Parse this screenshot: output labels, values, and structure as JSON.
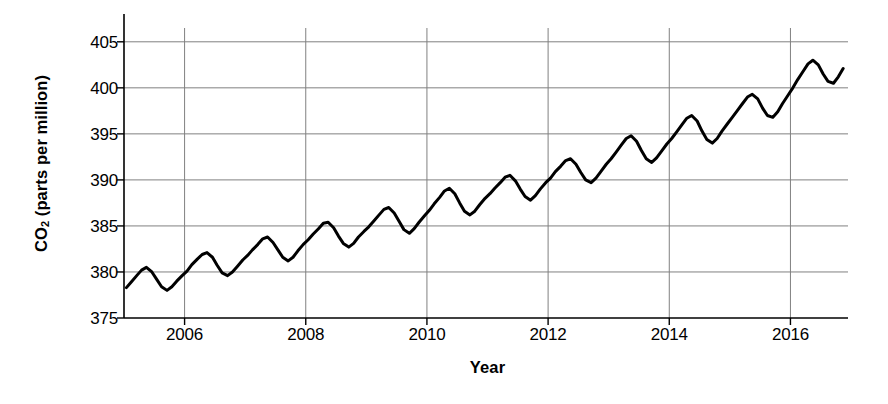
{
  "chart_data": {
    "type": "line",
    "title": "",
    "xlabel": "Year",
    "ylabel": "CO2 (parts per million)",
    "ylabel_parts": {
      "pre": "CO",
      "sub": "2",
      "post": " (parts per million)"
    },
    "xlim": [
      2005.0,
      2016.95
    ],
    "ylim": [
      375,
      406.5
    ],
    "yticks": [
      375,
      380,
      385,
      390,
      395,
      400,
      405
    ],
    "ytick_labels": [
      "375",
      "380",
      "385",
      "390",
      "395",
      "400",
      "405"
    ],
    "xticks": [
      2006,
      2008,
      2010,
      2012,
      2014,
      2016
    ],
    "xtick_labels": [
      "2006",
      "2008",
      "2010",
      "2012",
      "2014",
      "2016"
    ],
    "grid": true,
    "grid_color": "#808080",
    "line_color": "#000000",
    "line_width": 3.0,
    "axis_color": "#000000",
    "series_name": "Atmospheric CO2 concentration",
    "x": [
      2005.04,
      2005.12,
      2005.21,
      2005.29,
      2005.37,
      2005.46,
      2005.54,
      2005.62,
      2005.71,
      2005.79,
      2005.87,
      2005.96,
      2006.04,
      2006.12,
      2006.21,
      2006.29,
      2006.37,
      2006.46,
      2006.54,
      2006.62,
      2006.71,
      2006.79,
      2006.87,
      2006.96,
      2007.04,
      2007.12,
      2007.21,
      2007.29,
      2007.37,
      2007.46,
      2007.54,
      2007.62,
      2007.71,
      2007.79,
      2007.87,
      2007.96,
      2008.04,
      2008.12,
      2008.21,
      2008.29,
      2008.37,
      2008.46,
      2008.54,
      2008.62,
      2008.71,
      2008.79,
      2008.87,
      2008.96,
      2009.04,
      2009.12,
      2009.21,
      2009.29,
      2009.37,
      2009.46,
      2009.54,
      2009.62,
      2009.71,
      2009.79,
      2009.87,
      2009.96,
      2010.04,
      2010.12,
      2010.21,
      2010.29,
      2010.37,
      2010.46,
      2010.54,
      2010.62,
      2010.71,
      2010.79,
      2010.87,
      2010.96,
      2011.04,
      2011.12,
      2011.21,
      2011.29,
      2011.37,
      2011.46,
      2011.54,
      2011.62,
      2011.71,
      2011.79,
      2011.87,
      2011.96,
      2012.04,
      2012.12,
      2012.21,
      2012.29,
      2012.37,
      2012.46,
      2012.54,
      2012.62,
      2012.71,
      2012.79,
      2012.87,
      2012.96,
      2013.04,
      2013.12,
      2013.21,
      2013.29,
      2013.37,
      2013.46,
      2013.54,
      2013.62,
      2013.71,
      2013.79,
      2013.87,
      2013.96,
      2014.04,
      2014.12,
      2014.21,
      2014.29,
      2014.37,
      2014.46,
      2014.54,
      2014.62,
      2014.71,
      2014.79,
      2014.87,
      2014.96,
      2015.04,
      2015.12,
      2015.21,
      2015.29,
      2015.37,
      2015.46,
      2015.54,
      2015.62,
      2015.71,
      2015.79,
      2015.87,
      2015.96,
      2016.04,
      2016.12,
      2016.21,
      2016.29,
      2016.37,
      2016.46,
      2016.54,
      2016.62,
      2016.71,
      2016.79,
      2016.87
    ],
    "y": [
      378.3,
      378.9,
      379.6,
      380.2,
      380.5,
      380.0,
      379.2,
      378.4,
      378.0,
      378.4,
      379.0,
      379.6,
      380.1,
      380.8,
      381.4,
      381.9,
      382.1,
      381.6,
      380.7,
      379.9,
      379.6,
      380.0,
      380.6,
      381.3,
      381.8,
      382.4,
      383.0,
      383.6,
      383.8,
      383.2,
      382.4,
      381.6,
      381.2,
      381.6,
      382.3,
      383.0,
      383.5,
      384.1,
      384.7,
      385.3,
      385.4,
      384.8,
      383.9,
      383.1,
      382.7,
      383.1,
      383.8,
      384.4,
      384.9,
      385.5,
      386.2,
      386.8,
      387.0,
      386.4,
      385.5,
      384.6,
      384.2,
      384.7,
      385.4,
      386.1,
      386.7,
      387.4,
      388.1,
      388.8,
      389.1,
      388.5,
      387.5,
      386.6,
      386.2,
      386.6,
      387.3,
      388.0,
      388.5,
      389.1,
      389.7,
      390.3,
      390.5,
      389.9,
      389.0,
      388.2,
      387.8,
      388.3,
      389.0,
      389.7,
      390.2,
      390.9,
      391.5,
      392.1,
      392.3,
      391.7,
      390.8,
      390.0,
      389.7,
      390.2,
      390.9,
      391.7,
      392.3,
      393.0,
      393.8,
      394.5,
      394.8,
      394.2,
      393.2,
      392.3,
      391.9,
      392.4,
      393.1,
      393.9,
      394.5,
      395.2,
      396.0,
      396.7,
      397.0,
      396.4,
      395.3,
      394.4,
      394.0,
      394.5,
      395.3,
      396.1,
      396.8,
      397.5,
      398.3,
      399.0,
      399.3,
      398.8,
      397.8,
      397.0,
      396.8,
      397.4,
      398.3,
      399.2,
      400.0,
      400.9,
      401.8,
      402.6,
      403.0,
      402.5,
      401.5,
      400.7,
      400.5,
      401.2,
      402.1
    ]
  }
}
